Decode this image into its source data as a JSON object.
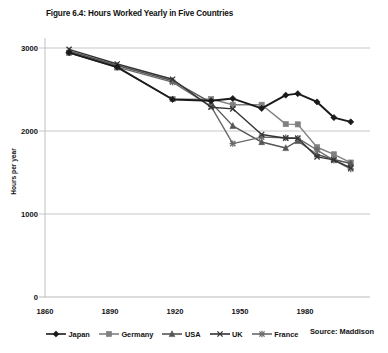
{
  "figure": {
    "title": "Figure 6.4: Hours Worked Yearly in Five Countries",
    "source": "Source: Maddison"
  },
  "axes": {
    "ylabel": "Hours per year",
    "yticks": [
      "0",
      "1000",
      "2000",
      "3000"
    ],
    "xticks": [
      "1860",
      "1890",
      "1920",
      "1950",
      "1980"
    ]
  },
  "legend": {
    "items": [
      {
        "label": "Japan",
        "marker": "diamond-marker",
        "color": "#1a1a1a"
      },
      {
        "label": "Germany",
        "marker": "square-marker",
        "color": "#808080"
      },
      {
        "label": "USA",
        "marker": "triangle-marker",
        "color": "#555555"
      },
      {
        "label": "UK",
        "marker": "cross-marker",
        "color": "#333333"
      },
      {
        "label": "France",
        "marker": "asterisk-marker",
        "color": "#6a6a6a"
      }
    ]
  },
  "chart_data": {
    "type": "line",
    "title": "Figure 6.4: Hours Worked Yearly in Five Countries",
    "xlabel": "",
    "ylabel": "Hours per year",
    "xlim": [
      1860,
      1995
    ],
    "ylim": [
      0,
      3000
    ],
    "yticks": [
      0,
      1000,
      2000,
      3000
    ],
    "xticks": [
      1860,
      1890,
      1920,
      1950,
      1980
    ],
    "grid": "horizontal",
    "legend_position": "bottom",
    "source": "Source: Maddison",
    "series": [
      {
        "name": "Japan",
        "marker": "diamond",
        "color": "#1a1a1a",
        "x": [
          1870,
          1890,
          1913,
          1929,
          1938,
          1950,
          1960,
          1965,
          1973,
          1980,
          1987
        ],
        "y": [
          2945,
          2770,
          2380,
          2364,
          2391,
          2272,
          2432,
          2450,
          2350,
          2162,
          2110
        ]
      },
      {
        "name": "Germany",
        "marker": "square",
        "color": "#808080",
        "x": [
          1870,
          1890,
          1913,
          1929,
          1938,
          1950,
          1960,
          1965,
          1973,
          1980,
          1987
        ],
        "y": [
          2941,
          2765,
          2384,
          2384,
          2316,
          2316,
          2083,
          2080,
          1804,
          1719,
          1620
        ]
      },
      {
        "name": "USA",
        "marker": "triangle",
        "color": "#555555",
        "x": [
          1870,
          1890,
          1913,
          1929,
          1938,
          1950,
          1960,
          1965,
          1973,
          1980,
          1987
        ],
        "y": [
          2964,
          2789,
          2605,
          2342,
          2062,
          1867,
          1795,
          1880,
          1717,
          1657,
          1608
        ]
      },
      {
        "name": "UK",
        "marker": "cross",
        "color": "#333333",
        "x": [
          1870,
          1890,
          1913,
          1929,
          1938,
          1950,
          1960,
          1965,
          1973,
          1980,
          1987
        ],
        "y": [
          2984,
          2807,
          2624,
          2286,
          2267,
          1958,
          1913,
          1913,
          1688,
          1652,
          1557
        ]
      },
      {
        "name": "France",
        "marker": "asterisk",
        "color": "#6a6a6a",
        "x": [
          1870,
          1890,
          1913,
          1929,
          1938,
          1950,
          1960,
          1965,
          1973,
          1980,
          1987
        ],
        "y": [
          2945,
          2770,
          2588,
          2297,
          1848,
          1926,
          1919,
          1913,
          1771,
          1646,
          1543
        ]
      }
    ]
  }
}
